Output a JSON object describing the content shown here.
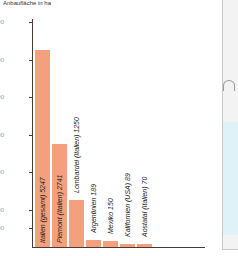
{
  "chart_data": {
    "type": "bar",
    "title": "",
    "ylabel": "Anbaufläche in ha",
    "xlabel": "",
    "ylim": [
      0,
      6000
    ],
    "yticks": [
      500,
      1000,
      2000,
      3000,
      4000,
      5000,
      6000
    ],
    "grid": false,
    "categories": [
      "Italien (gesamt)",
      "Piemont (Italien)",
      "Lombardei (Italien)",
      "Argentinien",
      "Mexiko",
      "Kalifornien (USA)",
      "Aostatal (Italien)"
    ],
    "values": [
      5247,
      2741,
      1250,
      189,
      150,
      89,
      70
    ],
    "bar_labels": [
      "Italien (gesamt) 5247",
      "Piemont (Italien) 2741",
      "Lombardei (Italien) 1250",
      "Argentinien 189",
      "Mexiko 150",
      "Kalifornien (USA) 89",
      "Aostatal (Italien) 70"
    ],
    "bar_color": "#f4a07c"
  },
  "axis": {
    "ylabel": "Anbaufläche in ha",
    "ticks": [
      {
        "label": "6000",
        "value": 6000
      },
      {
        "label": "5000",
        "value": 5000
      },
      {
        "label": "4000",
        "value": 4000
      },
      {
        "label": "3000",
        "value": 3000
      },
      {
        "label": "2000",
        "value": 2000
      },
      {
        "label": "1000",
        "value": 1000
      },
      {
        "label": "500",
        "value": 500
      }
    ]
  },
  "bars": [
    {
      "label": "Italien (gesamt) 5247",
      "value": 5247
    },
    {
      "label": "Piemont (Italien) 2741",
      "value": 2741
    },
    {
      "label": "Lombardei (Italien) 1250",
      "value": 1250
    },
    {
      "label": "Argentinien 189",
      "value": 189
    },
    {
      "label": "Mexiko 150",
      "value": 150
    },
    {
      "label": "Kalifornien (USA) 89",
      "value": 89
    },
    {
      "label": "Aostatal (Italien) 70",
      "value": 70
    }
  ]
}
